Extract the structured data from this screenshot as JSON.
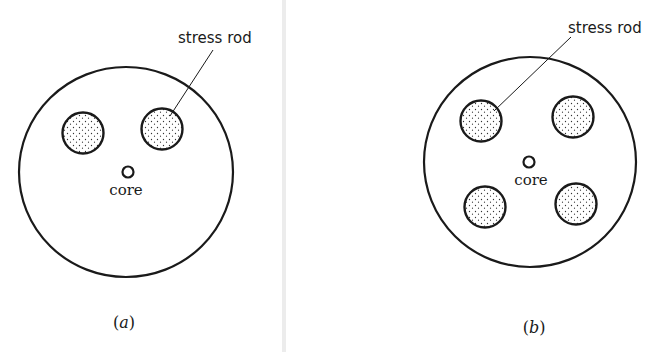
{
  "figure": {
    "divider_color": "#ececec",
    "ink_color": "#1a1a1a",
    "panels": [
      {
        "id": "a",
        "caption_open": "(",
        "caption_letter": "a",
        "caption_close": ")",
        "stress_rod_label": "stress rod",
        "core_label": "core",
        "stress_rod_count": 2
      },
      {
        "id": "b",
        "caption_open": "(",
        "caption_letter": "b",
        "caption_close": ")",
        "stress_rod_label": "stress rod",
        "core_label": "core",
        "stress_rod_count": 4
      }
    ]
  }
}
